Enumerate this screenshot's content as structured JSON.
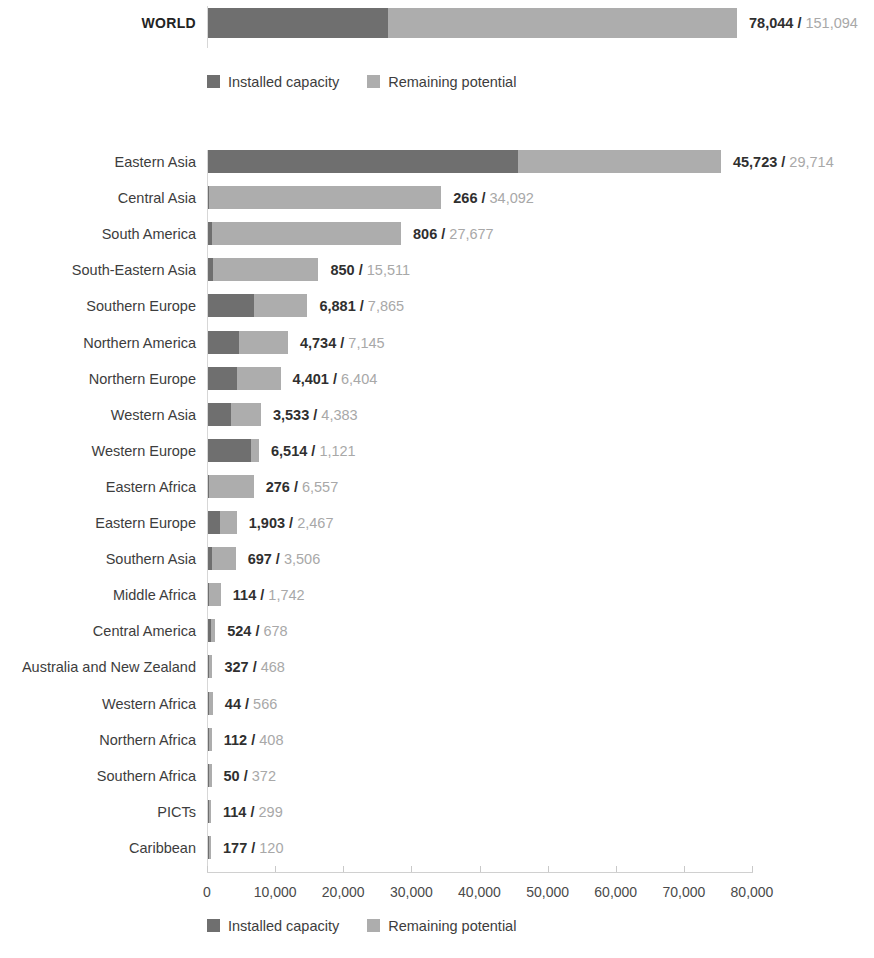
{
  "chart_data": {
    "type": "bar",
    "subtype": "stacked-horizontal",
    "title": "",
    "xlabel": "",
    "ylabel": "",
    "xlim": [
      0,
      80000
    ],
    "grid": false,
    "legend_position": "bottom",
    "series": [
      {
        "name": "Installed capacity",
        "color": "#6f6f6f"
      },
      {
        "name": "Remaining potential",
        "color": "#adadad"
      }
    ],
    "xticks": [
      0,
      10000,
      20000,
      30000,
      40000,
      50000,
      60000,
      70000,
      80000
    ],
    "xtick_labels": [
      "0",
      "10,000",
      "20,000",
      "30,000",
      "40,000",
      "50,000",
      "60,000",
      "70,000",
      "80,000"
    ],
    "categories": [
      "Eastern Asia",
      "Central Asia",
      "South America",
      "South-Eastern Asia",
      "Southern Europe",
      "Northern America",
      "Northern Europe",
      "Western Asia",
      "Western Europe",
      "Eastern Africa",
      "Eastern Europe",
      "Southern Asia",
      "Middle Africa",
      "Central America",
      "Australia and New Zealand",
      "Western Africa",
      "Northern Africa",
      "Southern Africa",
      "PICTs",
      "Caribbean"
    ],
    "installed": [
      45723,
      266,
      806,
      850,
      6881,
      4734,
      4401,
      3533,
      6514,
      276,
      1903,
      697,
      114,
      524,
      327,
      44,
      112,
      50,
      114,
      177
    ],
    "remaining": [
      29714,
      34092,
      27677,
      15511,
      7865,
      7145,
      6404,
      4383,
      1121,
      6557,
      2467,
      3506,
      1742,
      678,
      468,
      566,
      408,
      372,
      299,
      120
    ]
  },
  "world": {
    "label": "WORLD",
    "installed": 78044,
    "remaining": 151094,
    "installed_text": "78,044",
    "separator": " / ",
    "remaining_text": "151,094"
  },
  "legend": {
    "installed_label": "Installed capacity",
    "remaining_label": "Remaining potential"
  },
  "rows": [
    {
      "label": "Eastern Asia",
      "installed_text": "45,723",
      "remaining_text": "29,714",
      "installed": 45723,
      "remaining": 29714
    },
    {
      "label": "Central Asia",
      "installed_text": "266",
      "remaining_text": "34,092",
      "installed": 266,
      "remaining": 34092
    },
    {
      "label": "South America",
      "installed_text": "806",
      "remaining_text": "27,677",
      "installed": 806,
      "remaining": 27677
    },
    {
      "label": "South-Eastern Asia",
      "installed_text": "850",
      "remaining_text": "15,511",
      "installed": 850,
      "remaining": 15511
    },
    {
      "label": "Southern Europe",
      "installed_text": "6,881",
      "remaining_text": "7,865",
      "installed": 6881,
      "remaining": 7865
    },
    {
      "label": "Northern America",
      "installed_text": "4,734",
      "remaining_text": "7,145",
      "installed": 4734,
      "remaining": 7145
    },
    {
      "label": "Northern Europe",
      "installed_text": "4,401",
      "remaining_text": "6,404",
      "installed": 4401,
      "remaining": 6404
    },
    {
      "label": "Western Asia",
      "installed_text": "3,533",
      "remaining_text": "4,383",
      "installed": 3533,
      "remaining": 4383
    },
    {
      "label": "Western Europe",
      "installed_text": "6,514",
      "remaining_text": "1,121",
      "installed": 6514,
      "remaining": 1121
    },
    {
      "label": "Eastern Africa",
      "installed_text": "276",
      "remaining_text": "6,557",
      "installed": 276,
      "remaining": 6557
    },
    {
      "label": "Eastern Europe",
      "installed_text": "1,903",
      "remaining_text": "2,467",
      "installed": 1903,
      "remaining": 2467
    },
    {
      "label": "Southern Asia",
      "installed_text": "697",
      "remaining_text": "3,506",
      "installed": 697,
      "remaining": 3506
    },
    {
      "label": "Middle Africa",
      "installed_text": "114",
      "remaining_text": "1,742",
      "installed": 114,
      "remaining": 1742
    },
    {
      "label": "Central America",
      "installed_text": "524",
      "remaining_text": "678",
      "installed": 524,
      "remaining": 678
    },
    {
      "label": "Australia and New Zealand",
      "installed_text": "327",
      "remaining_text": "468",
      "installed": 327,
      "remaining": 468
    },
    {
      "label": "Western Africa",
      "installed_text": "44",
      "remaining_text": "566",
      "installed": 44,
      "remaining": 566
    },
    {
      "label": "Northern Africa",
      "installed_text": "112",
      "remaining_text": "408",
      "installed": 112,
      "remaining": 408
    },
    {
      "label": "Southern Africa",
      "installed_text": "50",
      "remaining_text": "372",
      "installed": 50,
      "remaining": 372
    },
    {
      "label": "PICTs",
      "installed_text": "114",
      "remaining_text": "299",
      "installed": 114,
      "remaining": 299
    },
    {
      "label": "Caribbean",
      "installed_text": "177",
      "remaining_text": "120",
      "installed": 177,
      "remaining": 120
    }
  ],
  "separator": " / "
}
